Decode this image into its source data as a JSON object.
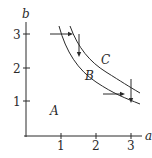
{
  "axes": {
    "x_label": "a",
    "y_label": "b",
    "x_ticks": [
      "1",
      "2",
      "3"
    ],
    "y_ticks": [
      "1",
      "2",
      "3"
    ]
  },
  "regions": {
    "A": "A",
    "B": "B",
    "C": "C"
  },
  "curves": [
    {
      "name": "inner-boundary",
      "description": "b = k1/a"
    },
    {
      "name": "outer-boundary",
      "description": "b = k2/a"
    }
  ],
  "arrows": [
    {
      "name": "horizontal-arrow-top",
      "from": [
        0.7,
        3
      ],
      "to": [
        1.3,
        3
      ]
    },
    {
      "name": "vertical-arrow-top",
      "from": [
        1.5,
        3
      ],
      "to": [
        1.5,
        2.35
      ]
    },
    {
      "name": "horizontal-arrow-bottom",
      "from": [
        2.2,
        1.2
      ],
      "to": [
        2.8,
        1.2
      ]
    },
    {
      "name": "vertical-arrow-bottom",
      "from": [
        3,
        1.65
      ],
      "to": [
        3,
        1.0
      ]
    }
  ],
  "colors": {
    "ink": "#2a2a2a",
    "background": "#ffffff"
  }
}
